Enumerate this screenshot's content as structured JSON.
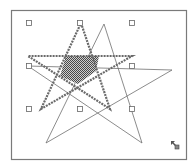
{
  "canvas": {
    "width": 195,
    "height": 166,
    "background": "#ffffff",
    "frame": {
      "x": 11,
      "y": 10,
      "w": 175,
      "h": 149,
      "stroke": "#7a7a7a"
    }
  },
  "shapes": {
    "thin_star": {
      "points": [
        [
          104,
          24
        ],
        [
          142,
          143
        ],
        [
          28,
          66
        ],
        [
          172,
          70
        ],
        [
          46,
          143
        ]
      ],
      "stroke": "#6e6e6e"
    },
    "selected_star": {
      "points": [
        [
          81,
          23
        ],
        [
          110,
          109
        ],
        [
          28,
          56
        ],
        [
          132,
          56
        ],
        [
          41,
          109
        ]
      ],
      "stroke": "#6a6a6a",
      "pattern": "hatched-dashed"
    },
    "filled_center": {
      "points": [
        [
          66,
          56
        ],
        [
          99,
          56
        ],
        [
          96,
          71
        ],
        [
          78,
          84
        ],
        [
          60,
          76
        ]
      ],
      "fill": "#6b6b6b"
    }
  },
  "selection_handles": [
    [
      29,
      23
    ],
    [
      80,
      23
    ],
    [
      132,
      23
    ],
    [
      29,
      66
    ],
    [
      132,
      66
    ],
    [
      29,
      109
    ],
    [
      80,
      109
    ],
    [
      132,
      109
    ]
  ],
  "cursor": {
    "icon": "resize-cursor-icon",
    "x": 171,
    "y": 141
  }
}
